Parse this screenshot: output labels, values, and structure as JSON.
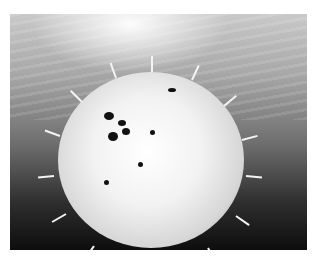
{
  "image": {
    "subject": "pufferfish",
    "description": "Grayscale underwater photo of an inflated spiny pufferfish",
    "colors": {
      "background_top": "#c9c9c9",
      "background_bottom": "#0d0d0d",
      "fish": "#f2f2f2",
      "spots": "#111111"
    }
  }
}
